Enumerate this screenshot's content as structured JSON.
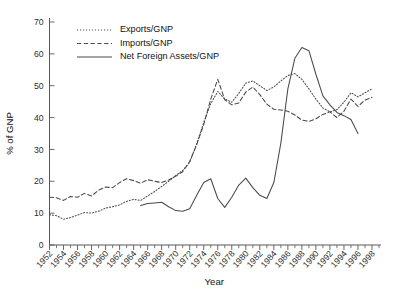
{
  "chart_data": {
    "type": "line",
    "title": "",
    "xlabel": "Year",
    "ylabel": "% of GNP",
    "xlim": [
      1952,
      1999
    ],
    "ylim": [
      0,
      70
    ],
    "yticks": [
      0,
      10,
      20,
      30,
      40,
      50,
      60,
      70
    ],
    "xticks": [
      1952,
      1954,
      1956,
      1958,
      1960,
      1962,
      1964,
      1966,
      1968,
      1970,
      1972,
      1974,
      1976,
      1978,
      1980,
      1982,
      1984,
      1986,
      1988,
      1990,
      1992,
      1994,
      1996,
      1998
    ],
    "x_minor_step": 1,
    "grid": false,
    "legend_position": "top-left",
    "series": [
      {
        "name": "Exports/GNP",
        "style": "dotted",
        "x": [
          1952,
          1953,
          1954,
          1955,
          1956,
          1957,
          1958,
          1959,
          1960,
          1961,
          1962,
          1963,
          1964,
          1965,
          1966,
          1967,
          1968,
          1969,
          1970,
          1971,
          1972,
          1973,
          1974,
          1975,
          1976,
          1977,
          1978,
          1979,
          1980,
          1981,
          1982,
          1983,
          1984,
          1985,
          1986,
          1987,
          1988,
          1989,
          1990,
          1991,
          1992,
          1993,
          1994,
          1995,
          1996,
          1997,
          1998
        ],
        "values": [
          9.5,
          9.2,
          8.1,
          8.6,
          9.4,
          10.2,
          10.0,
          10.6,
          11.6,
          12.0,
          12.6,
          13.7,
          14.3,
          14.0,
          15.4,
          16.8,
          18.4,
          20.0,
          21.8,
          23.4,
          26.0,
          31.8,
          38.5,
          44.4,
          48.2,
          45.8,
          44.8,
          47.6,
          50.8,
          51.5,
          50.0,
          48.5,
          49.6,
          51.5,
          53.2,
          53.8,
          52.0,
          49.0,
          45.8,
          43.0,
          41.8,
          42.5,
          44.8,
          47.8,
          46.5,
          47.8,
          49.0
        ]
      },
      {
        "name": "Imports/GNP",
        "style": "dashed",
        "x": [
          1952,
          1953,
          1954,
          1955,
          1956,
          1957,
          1958,
          1959,
          1960,
          1961,
          1962,
          1963,
          1964,
          1965,
          1966,
          1967,
          1968,
          1969,
          1970,
          1971,
          1972,
          1973,
          1974,
          1975,
          1976,
          1977,
          1978,
          1979,
          1980,
          1981,
          1982,
          1983,
          1984,
          1985,
          1986,
          1987,
          1988,
          1989,
          1990,
          1991,
          1992,
          1993,
          1994,
          1995,
          1996,
          1997,
          1998
        ],
        "values": [
          15.0,
          14.8,
          14.0,
          15.2,
          15.0,
          16.2,
          15.4,
          17.2,
          18.2,
          18.0,
          19.6,
          20.8,
          20.2,
          19.4,
          20.5,
          20.0,
          19.6,
          20.4,
          21.6,
          23.0,
          26.2,
          31.5,
          37.8,
          45.8,
          52.0,
          45.6,
          44.0,
          44.6,
          48.0,
          49.6,
          47.2,
          44.2,
          42.6,
          42.4,
          42.0,
          40.8,
          39.2,
          38.8,
          39.6,
          41.0,
          41.8,
          40.0,
          42.0,
          45.8,
          43.5,
          45.5,
          46.4
        ]
      },
      {
        "name": "Net Foreign Assets/GNP",
        "style": "solid",
        "x": [
          1965,
          1966,
          1967,
          1968,
          1969,
          1970,
          1971,
          1972,
          1973,
          1974,
          1975,
          1976,
          1977,
          1978,
          1979,
          1980,
          1981,
          1982,
          1983,
          1984,
          1985,
          1986,
          1987,
          1988,
          1989,
          1990,
          1991,
          1992,
          1993,
          1994,
          1995,
          1996
        ],
        "values": [
          12.4,
          13.0,
          13.2,
          13.4,
          12.0,
          10.8,
          10.6,
          11.4,
          15.6,
          19.6,
          20.8,
          14.6,
          11.8,
          15.0,
          18.8,
          21.0,
          18.0,
          15.6,
          14.6,
          19.6,
          32.0,
          49.0,
          58.6,
          62.0,
          61.0,
          53.6,
          46.8,
          44.0,
          41.6,
          40.6,
          39.4,
          35.0
        ]
      }
    ]
  },
  "legend": {
    "items": [
      {
        "label": "Exports/GNP"
      },
      {
        "label": "Imports/GNP"
      },
      {
        "label": "Net Foreign Assets/GNP"
      }
    ]
  },
  "axes": {
    "x_title": "Year",
    "y_title": "% of GNP"
  }
}
